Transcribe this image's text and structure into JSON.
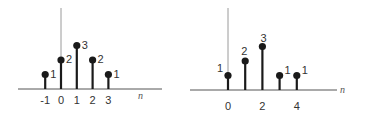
{
  "chart_data": [
    {
      "type": "stem",
      "title": "",
      "xlabel": "n",
      "ylabel": "",
      "x": [
        -1,
        0,
        1,
        2,
        3
      ],
      "values": [
        1,
        2,
        3,
        2,
        1
      ],
      "tick_labels": [
        "-1",
        "0",
        "1",
        "2",
        "3"
      ],
      "value_labels": [
        "1",
        "2",
        "3",
        "2",
        "1"
      ],
      "grid": false,
      "legend": null
    },
    {
      "type": "stem",
      "title": "",
      "xlabel": "n",
      "ylabel": "",
      "x": [
        0,
        1,
        2,
        3,
        4
      ],
      "values": [
        1,
        2,
        3,
        1,
        1
      ],
      "tick_labels": [
        "0",
        "2",
        "4"
      ],
      "tick_positions": [
        0,
        2,
        4
      ],
      "value_labels": [
        "1",
        "2",
        "3",
        "1",
        "1"
      ],
      "grid": false,
      "legend": null
    }
  ],
  "colors": {
    "stem": "#1a1a1a",
    "axis": "#333333",
    "y_axis": "#9a9a9a",
    "text": "#333333"
  }
}
